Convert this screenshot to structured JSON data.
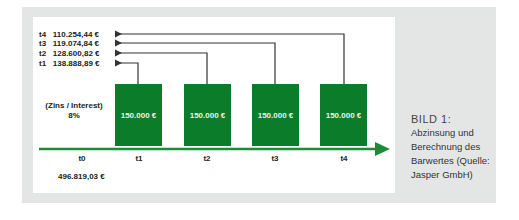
{
  "diagram": {
    "present_values": [
      {
        "period": "t4",
        "value": "110.254,44 €"
      },
      {
        "period": "t3",
        "value": "119.074,84 €"
      },
      {
        "period": "t2",
        "value": "128.600,82 €"
      },
      {
        "period": "t1",
        "value": "138.888,89 €"
      }
    ],
    "interest_label": "(Zins / Interest)",
    "interest_rate": "8%",
    "payments": [
      {
        "period": "t1",
        "amount": "150.000 €"
      },
      {
        "period": "t2",
        "amount": "150.000 €"
      },
      {
        "period": "t3",
        "amount": "150.000 €"
      },
      {
        "period": "t4",
        "amount": "150.000 €"
      }
    ],
    "timeline_ticks": [
      "t0",
      "t1",
      "t2",
      "t3",
      "t4"
    ],
    "total_present_value": "496.819,03 €",
    "colors": {
      "payment_box": "#0b7d2a",
      "timeline": "#1e8c36",
      "arrows": "#333333"
    }
  },
  "caption": {
    "title": "BILD 1:",
    "text": "Abzinsung und Berechnung des Barwertes (Quelle: Jasper GmbH)"
  }
}
